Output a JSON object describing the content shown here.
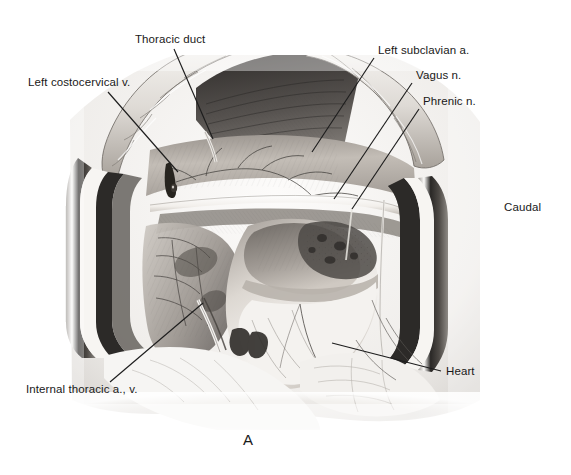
{
  "figure": {
    "panel_letter": "A",
    "orientation_label": "Caudal",
    "caption_alt": "Surgical exposure of the left cranial mediastinum through a thoracotomy, with rib retractors in place"
  },
  "labels": [
    {
      "id": "thoracic-duct",
      "text": "Thoracic duct",
      "x": 135,
      "y": 33,
      "leader": {
        "x1": 174,
        "y1": 49,
        "x2": 213,
        "y2": 139
      }
    },
    {
      "id": "left-costocervical-v",
      "text": "Left costocervical v.",
      "x": 28,
      "y": 76,
      "leader": {
        "x1": 108,
        "y1": 92,
        "x2": 178,
        "y2": 172
      }
    },
    {
      "id": "left-subclavian-a",
      "text": "Left subclavian a.",
      "x": 378,
      "y": 44,
      "leader": {
        "x1": 374,
        "y1": 58,
        "x2": 312,
        "y2": 152
      }
    },
    {
      "id": "vagus-n",
      "text": "Vagus n.",
      "x": 416,
      "y": 69,
      "leader": {
        "x1": 412,
        "y1": 83,
        "x2": 334,
        "y2": 199
      }
    },
    {
      "id": "phrenic-n",
      "text": "Phrenic n.",
      "x": 423,
      "y": 95,
      "leader": {
        "x1": 419,
        "y1": 109,
        "x2": 352,
        "y2": 209
      }
    },
    {
      "id": "heart",
      "text": "Heart",
      "x": 446,
      "y": 365,
      "leader": {
        "x1": 441,
        "y1": 371,
        "x2": 332,
        "y2": 343
      }
    },
    {
      "id": "internal-thoracic-av",
      "text": "Internal thoracic a., v.",
      "x": 26,
      "y": 383,
      "leader": {
        "x1": 110,
        "y1": 382,
        "x2": 203,
        "y2": 303
      }
    }
  ],
  "orientation": {
    "x": 504,
    "y": 201
  },
  "panel": {
    "x": 243,
    "y": 431
  },
  "palette": {
    "background": "#ffffff",
    "ink": "#1d1d1d",
    "label_text": "#191919",
    "tissue_light": "#f1efec",
    "tissue_mid": "#bdb9b4",
    "tissue_dark": "#6e6a67",
    "cavity_shadow": "#3a3735",
    "vessel_white": "#fbfaf8",
    "retractor": "#2b2927"
  }
}
